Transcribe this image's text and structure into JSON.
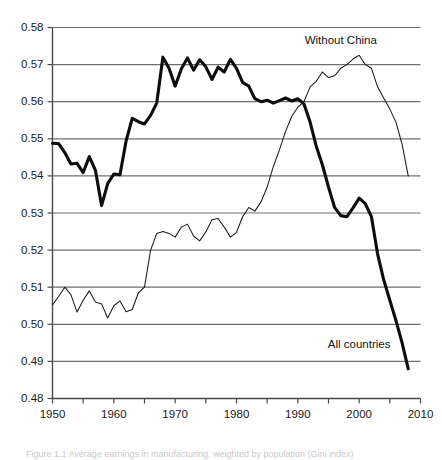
{
  "figure": {
    "caption_partial": "Figure 1.1 Average earnings in manufacturing, weighted by population (Gini index)"
  },
  "chart_data": {
    "type": "line",
    "title": "",
    "subtitle": "",
    "xlabel": "",
    "ylabel": "",
    "xlim": [
      1950,
      2010
    ],
    "ylim": [
      0.48,
      0.58
    ],
    "grid": "horizontal",
    "legend_position": "inline-annotation",
    "y_ticks": [
      "0.48",
      "0.49",
      "0.50",
      "0.51",
      "0.52",
      "0.53",
      "0.54",
      "0.55",
      "0.56",
      "0.57",
      "0.58"
    ],
    "y_tick_values": [
      0.48,
      0.49,
      0.5,
      0.51,
      0.52,
      0.53,
      0.54,
      0.55,
      0.56,
      0.57,
      0.58
    ],
    "x_ticks_labeled": [
      "1950",
      "1960",
      "1970",
      "1980",
      "1990",
      "2000",
      "2010"
    ],
    "x_tick_values_labeled": [
      1950,
      1960,
      1970,
      1980,
      1990,
      2000,
      2010
    ],
    "x_tick_values_minor": [
      1955,
      1965,
      1975,
      1985,
      1995,
      2005
    ],
    "annotations": [
      {
        "name": "without-china-label",
        "text": "Without China",
        "x": 1997,
        "y": 0.5755
      },
      {
        "name": "all-countries-label",
        "text": "All countries",
        "x": 2000,
        "y": 0.4935
      }
    ],
    "series": [
      {
        "name": "All countries",
        "style": "bold",
        "color": "#0d0d0d",
        "width": 3.1,
        "x": [
          1950,
          1951,
          1952,
          1953,
          1954,
          1955,
          1956,
          1957,
          1958,
          1959,
          1960,
          1961,
          1962,
          1963,
          1964,
          1965,
          1966,
          1967,
          1968,
          1969,
          1970,
          1971,
          1972,
          1973,
          1974,
          1975,
          1976,
          1977,
          1978,
          1979,
          1980,
          1981,
          1982,
          1983,
          1984,
          1985,
          1986,
          1987,
          1988,
          1989,
          1990,
          1991,
          1992,
          1993,
          1994,
          1995,
          1996,
          1997,
          1998,
          1999,
          2000,
          2001,
          2002,
          2003,
          2004,
          2005,
          2006,
          2007,
          2008
        ],
        "values": [
          0.5488,
          0.5487,
          0.5463,
          0.5432,
          0.5434,
          0.5409,
          0.5452,
          0.5415,
          0.532,
          0.5379,
          0.5405,
          0.5403,
          0.5494,
          0.5555,
          0.5546,
          0.554,
          0.5563,
          0.5597,
          0.572,
          0.569,
          0.5642,
          0.5688,
          0.5718,
          0.5685,
          0.5713,
          0.5694,
          0.566,
          0.5693,
          0.568,
          0.5714,
          0.569,
          0.5652,
          0.5642,
          0.5608,
          0.56,
          0.5604,
          0.5596,
          0.5603,
          0.561,
          0.5602,
          0.5608,
          0.5594,
          0.5545,
          0.548,
          0.543,
          0.537,
          0.5315,
          0.5293,
          0.529,
          0.5314,
          0.534,
          0.5325,
          0.529,
          0.519,
          0.512,
          0.5065,
          0.501,
          0.495,
          0.488
        ]
      },
      {
        "name": "Without China",
        "style": "thin",
        "color": "#1a1a1a",
        "width": 1.05,
        "x": [
          1950,
          1951,
          1952,
          1953,
          1954,
          1955,
          1956,
          1957,
          1958,
          1959,
          1960,
          1961,
          1962,
          1963,
          1964,
          1965,
          1966,
          1967,
          1968,
          1969,
          1970,
          1971,
          1972,
          1973,
          1974,
          1975,
          1976,
          1977,
          1978,
          1979,
          1980,
          1981,
          1982,
          1983,
          1984,
          1985,
          1986,
          1987,
          1988,
          1989,
          1990,
          1991,
          1992,
          1993,
          1994,
          1995,
          1996,
          1997,
          1998,
          1999,
          2000,
          2001,
          2002,
          2003,
          2004,
          2005,
          2006,
          2007,
          2008
        ],
        "values": [
          0.5052,
          0.5075,
          0.51,
          0.508,
          0.5033,
          0.5065,
          0.509,
          0.506,
          0.5055,
          0.5017,
          0.505,
          0.5063,
          0.5034,
          0.504,
          0.5085,
          0.51,
          0.52,
          0.5245,
          0.525,
          0.5245,
          0.5235,
          0.5262,
          0.527,
          0.5238,
          0.5225,
          0.5249,
          0.5282,
          0.5285,
          0.5262,
          0.5235,
          0.5248,
          0.529,
          0.5315,
          0.5305,
          0.533,
          0.537,
          0.5425,
          0.547,
          0.552,
          0.556,
          0.5585,
          0.56,
          0.564,
          0.5655,
          0.568,
          0.5665,
          0.567,
          0.569,
          0.57,
          0.5715,
          0.5725,
          0.57,
          0.569,
          0.564,
          0.561,
          0.558,
          0.5545,
          0.5485,
          0.54
        ]
      }
    ]
  }
}
